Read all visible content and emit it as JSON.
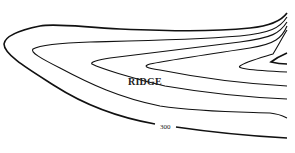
{
  "diagram": {
    "type": "topographic-contour-map",
    "feature_label": "RIDGE",
    "contour_labels": [
      {
        "text": "300",
        "contour": "outermost"
      }
    ],
    "line_color": "#111111",
    "background": "#ffffff",
    "contour_count": 6
  }
}
